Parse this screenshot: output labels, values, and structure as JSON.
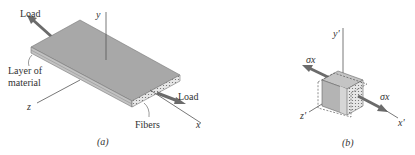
{
  "figure_a": {
    "caption": "(a)",
    "load_top_label": "Load",
    "load_bottom_label": "Load",
    "layer_label_line1": "Layer of",
    "layer_label_line2": "material",
    "fibers_label": "Fibers",
    "axis_x": "x",
    "axis_y": "y",
    "axis_z": "z"
  },
  "figure_b": {
    "caption": "(b)",
    "axis_x": "x'",
    "axis_y": "y'",
    "axis_z": "z'",
    "stress_left": "σx",
    "stress_right": "σx"
  },
  "colors": {
    "plate_top": "#a8a8a8",
    "plate_edge": "#c8c8c8",
    "arrow": "#6b6b6b",
    "line": "#555555",
    "cube_front": "#b8b8b8",
    "cube_top": "#c4c4c4"
  }
}
